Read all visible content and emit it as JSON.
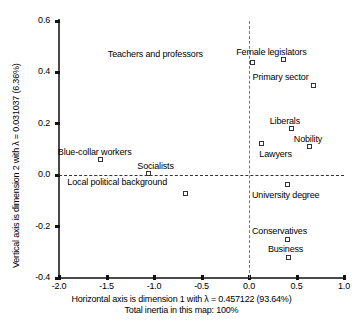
{
  "chart_data": {
    "type": "scatter",
    "title": "",
    "xlabel": "Horizontal axis is dimension 1 with λ = 0.457122 (93.64%)",
    "xlabel_sub": "Total inertia in this map: 100%",
    "ylabel": "Vertical axis is dimension 2 with λ = 0.031037 (6.36%)",
    "xlim": [
      -2.0,
      1.0
    ],
    "ylim": [
      -0.4,
      0.6
    ],
    "xticks": [
      "-2.0",
      "-1.5",
      "-1.0",
      "-0.5",
      "0.0",
      "0.5",
      "1.0"
    ],
    "xtick_values": [
      -2.0,
      -1.5,
      -1.0,
      -0.5,
      0.0,
      0.5,
      1.0
    ],
    "yticks": [
      "0.6",
      "0.4",
      "0.2",
      "0.0",
      "-0.2",
      "-0.4"
    ],
    "ytick_values": [
      0.6,
      0.4,
      0.2,
      0.0,
      -0.2,
      -0.4
    ],
    "grid": false,
    "legend": "none",
    "reference_lines": {
      "vertical_x": 0.0,
      "horizontal_y": 0.0
    },
    "marker": "open-square",
    "points": [
      {
        "label": "Teachers and professors",
        "x": 0.04,
        "y": 0.44,
        "label_dx": -145,
        "label_dy": -13
      },
      {
        "label": "Female legislators",
        "x": 0.36,
        "y": 0.45,
        "label_dx": -47,
        "label_dy": -13
      },
      {
        "label": "Primary sector",
        "x": 0.68,
        "y": 0.35,
        "label_dx": -61,
        "label_dy": -13
      },
      {
        "label": "Liberals",
        "x": 0.45,
        "y": 0.18,
        "label_dx": -22,
        "label_dy": -13
      },
      {
        "label": "Nobility",
        "x": 0.64,
        "y": 0.11,
        "label_dx": -16,
        "label_dy": -13
      },
      {
        "label": "Lawyers",
        "x": 0.13,
        "y": 0.125,
        "label_dx": -2,
        "label_dy": 6
      },
      {
        "label": "Blue-collar workers",
        "x": -1.56,
        "y": 0.06,
        "label_dx": -43,
        "label_dy": -13
      },
      {
        "label": "Socialists",
        "x": -1.06,
        "y": 0.005,
        "label_dx": -11,
        "label_dy": -13
      },
      {
        "label": "Local political background",
        "x": -0.67,
        "y": -0.07,
        "label_dx": -118,
        "label_dy": -16
      },
      {
        "label": "University degree",
        "x": 0.41,
        "y": -0.035,
        "label_dx": -36,
        "label_dy": 6
      },
      {
        "label": "Conservatives",
        "x": 0.41,
        "y": -0.25,
        "label_dx": -36,
        "label_dy": -13
      },
      {
        "label": "Business",
        "x": 0.42,
        "y": -0.32,
        "label_dx": -21,
        "label_dy": -13
      }
    ]
  }
}
